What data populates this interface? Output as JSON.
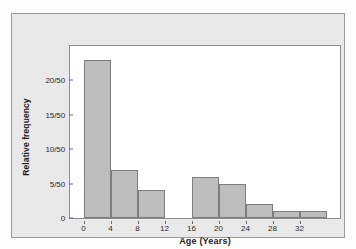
{
  "chart_data": {
    "type": "bar",
    "title": "",
    "subtitle": "",
    "xlabel": "Age (Years)",
    "ylabel": "Relative frequency",
    "categories": [
      "0-4",
      "4-8",
      "8-12",
      "12-16",
      "16-20",
      "20-24",
      "24-28",
      "28-32",
      "32-36"
    ],
    "bin_edges": [
      0,
      4,
      8,
      12,
      16,
      20,
      24,
      28,
      32,
      36
    ],
    "values": [
      23,
      7,
      4,
      0,
      6,
      5,
      2,
      1,
      1
    ],
    "value_denominator": 50,
    "xlim": [
      -2,
      38
    ],
    "ylim": [
      0,
      25
    ],
    "xticks": [
      0,
      4,
      8,
      12,
      16,
      20,
      24,
      28,
      32
    ],
    "xtick_labels": [
      "0",
      "4",
      "8",
      "12",
      "16",
      "20",
      "24",
      "28",
      "32"
    ],
    "yticks": [
      0,
      5,
      10,
      15,
      20
    ],
    "ytick_labels": [
      "0",
      "5/50",
      "10/50",
      "15/50",
      "20/50"
    ],
    "grid": false,
    "legend": false,
    "bar_fill_color": "#bdbdbd",
    "bar_edge_color": "#7d7d7d",
    "panel_background_color": "#e9e9e9",
    "plot_background_color": "#ffffff",
    "axis_color": "#8d8d8d"
  }
}
